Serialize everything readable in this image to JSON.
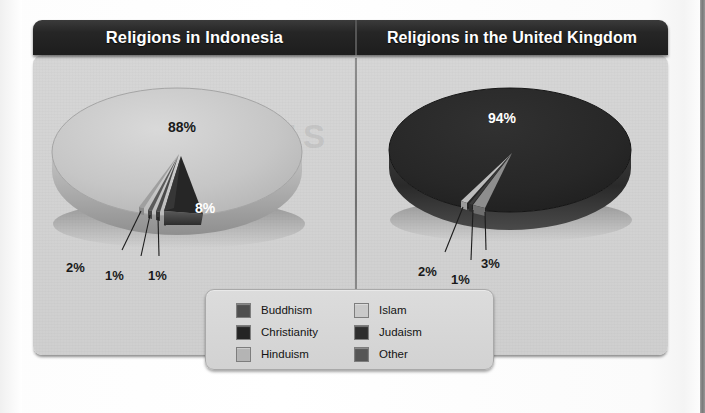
{
  "charts": [
    {
      "key": "indonesia",
      "title": "Religions in Indonesia",
      "labels": [
        {
          "text": "88%",
          "x": 120,
          "y": 45,
          "tone": "dark",
          "size": "big"
        },
        {
          "text": "8%",
          "x": 147,
          "y": 126,
          "tone": "light",
          "size": "big"
        },
        {
          "text": "2%",
          "x": 18,
          "y": 186,
          "tone": "dark",
          "size": "normal"
        },
        {
          "text": "1%",
          "x": 57,
          "y": 194,
          "tone": "dark",
          "size": "normal"
        },
        {
          "text": "1%",
          "x": 100,
          "y": 194,
          "tone": "dark",
          "size": "normal"
        }
      ]
    },
    {
      "key": "united-kingdom",
      "title": "Religions in the United Kingdom",
      "labels": [
        {
          "text": "94%",
          "x": 103,
          "y": 36,
          "tone": "light",
          "size": "big"
        },
        {
          "text": "2%",
          "x": 33,
          "y": 190,
          "tone": "dark",
          "size": "normal"
        },
        {
          "text": "1%",
          "x": 66,
          "y": 198,
          "tone": "dark",
          "size": "normal"
        },
        {
          "text": "3%",
          "x": 96,
          "y": 182,
          "tone": "dark",
          "size": "normal"
        }
      ]
    }
  ],
  "legend": {
    "columns": [
      [
        {
          "label": "Buddhism",
          "color": "#4e4e4e"
        },
        {
          "label": "Christianity",
          "color": "#242424"
        },
        {
          "label": "Hinduism",
          "color": "#b4b4b4"
        }
      ],
      [
        {
          "label": "Islam",
          "color": "#c9c9c9"
        },
        {
          "label": "Judaism",
          "color": "#2e2e2e"
        },
        {
          "label": "Other",
          "color": "#555555"
        }
      ]
    ]
  },
  "watermark": {
    "text": "ALAMOPLUS"
  },
  "colors": {
    "panel_background": "#d2d2d2",
    "title_bar": "#1d1d1d",
    "title_text": "#ffffff",
    "islam": "#c9c9c9",
    "christianity": "#242424",
    "hinduism": "#b4b4b4",
    "buddhism": "#4e4e4e",
    "judaism": "#2e2e2e",
    "other": "#555555"
  },
  "chart_data": [
    {
      "type": "pie",
      "title": "Religions in Indonesia",
      "categories": [
        "Islam",
        "Christianity",
        "Hinduism",
        "Buddhism",
        "Other"
      ],
      "values": [
        88,
        8,
        2,
        1,
        1
      ],
      "value_labels": [
        "88%",
        "8%",
        "2%",
        "1%",
        "1%"
      ],
      "colors": [
        "#c9c9c9",
        "#242424",
        "#b4b4b4",
        "#4e4e4e",
        "#555555"
      ],
      "unit": "%",
      "legend_position": "bottom-center-shared",
      "three_d": true
    },
    {
      "type": "pie",
      "title": "Religions in the United Kingdom",
      "categories": [
        "Christianity",
        "Other",
        "Islam",
        "Judaism"
      ],
      "values": [
        94,
        3,
        2,
        1
      ],
      "value_labels": [
        "94%",
        "3%",
        "2%",
        "1%"
      ],
      "colors": [
        "#242424",
        "#555555",
        "#c9c9c9",
        "#2e2e2e"
      ],
      "unit": "%",
      "legend_position": "bottom-center-shared",
      "three_d": true
    }
  ]
}
